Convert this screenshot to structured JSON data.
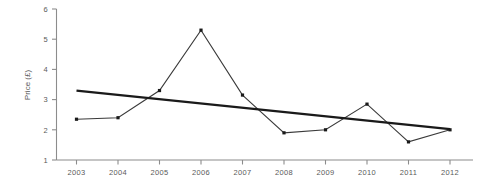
{
  "chart_data": {
    "type": "line",
    "title": "",
    "xlabel": "",
    "ylabel": "Price (£)",
    "categories": [
      "2003",
      "2004",
      "2005",
      "2006",
      "2007",
      "2008",
      "2009",
      "2010",
      "2011",
      "2012"
    ],
    "series": [
      {
        "name": "Price",
        "values": [
          2.35,
          2.4,
          3.3,
          5.3,
          3.15,
          1.9,
          2.0,
          2.85,
          1.6,
          2.0
        ],
        "marker": "square",
        "color": "#3a3a3a"
      },
      {
        "name": "Linear trend",
        "values": [
          3.3,
          3.16,
          3.01,
          2.87,
          2.73,
          2.58,
          2.44,
          2.29,
          2.15,
          2.02
        ],
        "marker": "none",
        "color": "#1a1a1a"
      }
    ],
    "ylim": [
      1,
      6
    ],
    "yticks": [
      "1",
      "2",
      "3",
      "4",
      "5",
      "6"
    ],
    "xticks": [
      "2003",
      "2004",
      "2005",
      "2006",
      "2007",
      "2008",
      "2009",
      "2010",
      "2011",
      "2012"
    ],
    "grid": false,
    "legend": "none"
  },
  "axes": {
    "y_axis_title": "Price (£)",
    "y_tick_labels": [
      "6",
      "5",
      "4",
      "3",
      "2",
      "1"
    ],
    "x_tick_labels": [
      "2003",
      "2004",
      "2005",
      "2006",
      "2007",
      "2008",
      "2009",
      "2010",
      "2011",
      "2012"
    ]
  },
  "colors": {
    "series_line": "#3a3a3a",
    "trend_line": "#1a1a1a",
    "axis": "#8c8c8c",
    "text": "#5a5a5a",
    "background": "#ffffff"
  }
}
